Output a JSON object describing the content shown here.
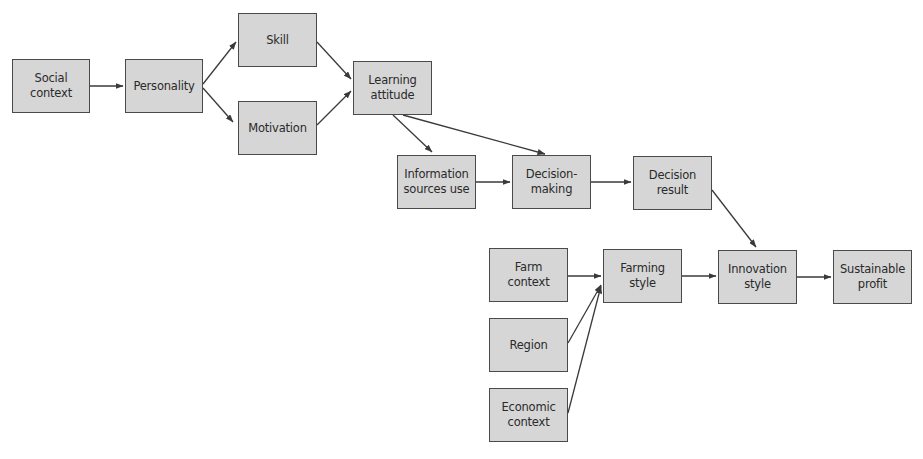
{
  "diagram": {
    "type": "flowchart",
    "colors": {
      "node_fill": "#d6d6d6",
      "node_border": "#4a4a4a",
      "text": "#2a2a2a",
      "edge": "#3a3a3a",
      "background": "#ffffff"
    },
    "nodes": [
      {
        "id": "social_context",
        "label": "Social\ncontext",
        "x": 12,
        "y": 59,
        "w": 78,
        "h": 54
      },
      {
        "id": "personality",
        "label": "Personality",
        "x": 125,
        "y": 59,
        "w": 78,
        "h": 54
      },
      {
        "id": "skill",
        "label": "Skill",
        "x": 238,
        "y": 13,
        "w": 79,
        "h": 54
      },
      {
        "id": "motivation",
        "label": "Motivation",
        "x": 238,
        "y": 101,
        "w": 79,
        "h": 54
      },
      {
        "id": "learning_attitude",
        "label": "Learning\nattitude",
        "x": 353,
        "y": 61,
        "w": 79,
        "h": 54
      },
      {
        "id": "information_sources_use",
        "label": "Information\nsources use",
        "x": 397,
        "y": 155,
        "w": 79,
        "h": 54
      },
      {
        "id": "decision_making",
        "label": "Decision-\nmaking",
        "x": 512,
        "y": 155,
        "w": 79,
        "h": 54
      },
      {
        "id": "decision_result",
        "label": "Decision\nresult",
        "x": 633,
        "y": 156,
        "w": 79,
        "h": 54
      },
      {
        "id": "farm_context",
        "label": "Farm\ncontext",
        "x": 489,
        "y": 248,
        "w": 79,
        "h": 54
      },
      {
        "id": "region",
        "label": "Region",
        "x": 489,
        "y": 318,
        "w": 79,
        "h": 54
      },
      {
        "id": "economic_context",
        "label": "Economic\ncontext",
        "x": 489,
        "y": 388,
        "w": 79,
        "h": 54
      },
      {
        "id": "farming_style",
        "label": "Farming\nstyle",
        "x": 603,
        "y": 249,
        "w": 79,
        "h": 54
      },
      {
        "id": "innovation_style",
        "label": "Innovation\nstyle",
        "x": 718,
        "y": 250,
        "w": 79,
        "h": 54
      },
      {
        "id": "sustainable_profit",
        "label": "Sustainable\nprofit",
        "x": 833,
        "y": 250,
        "w": 79,
        "h": 54
      }
    ],
    "edges": [
      {
        "from": "social_context",
        "to": "personality",
        "x1": 90,
        "y1": 86,
        "x2": 123,
        "y2": 86
      },
      {
        "from": "personality",
        "to": "skill",
        "x1": 203,
        "y1": 84,
        "x2": 236,
        "y2": 42
      },
      {
        "from": "personality",
        "to": "motivation",
        "x1": 203,
        "y1": 88,
        "x2": 233,
        "y2": 122
      },
      {
        "from": "skill",
        "to": "learning_attitude",
        "x1": 317,
        "y1": 42,
        "x2": 351,
        "y2": 79
      },
      {
        "from": "motivation",
        "to": "learning_attitude",
        "x1": 317,
        "y1": 125,
        "x2": 351,
        "y2": 91
      },
      {
        "from": "learning_attitude",
        "to": "information_sources_use",
        "x1": 393,
        "y1": 115,
        "x2": 432,
        "y2": 152
      },
      {
        "from": "learning_attitude",
        "to": "decision_making",
        "x1": 403,
        "y1": 115,
        "x2": 545,
        "y2": 154
      },
      {
        "from": "information_sources_use",
        "to": "decision_making",
        "x1": 476,
        "y1": 182,
        "x2": 510,
        "y2": 182
      },
      {
        "from": "decision_making",
        "to": "decision_result",
        "x1": 591,
        "y1": 182,
        "x2": 631,
        "y2": 182
      },
      {
        "from": "decision_result",
        "to": "innovation_style",
        "x1": 712,
        "y1": 190,
        "x2": 756,
        "y2": 247
      },
      {
        "from": "farm_context",
        "to": "farming_style",
        "x1": 568,
        "y1": 276,
        "x2": 601,
        "y2": 276
      },
      {
        "from": "region",
        "to": "farming_style",
        "x1": 568,
        "y1": 343,
        "x2": 601,
        "y2": 285
      },
      {
        "from": "economic_context",
        "to": "farming_style",
        "x1": 568,
        "y1": 413,
        "x2": 601,
        "y2": 286
      },
      {
        "from": "farming_style",
        "to": "innovation_style",
        "x1": 682,
        "y1": 276,
        "x2": 716,
        "y2": 276
      },
      {
        "from": "innovation_style",
        "to": "sustainable_profit",
        "x1": 797,
        "y1": 277,
        "x2": 831,
        "y2": 277
      }
    ]
  }
}
